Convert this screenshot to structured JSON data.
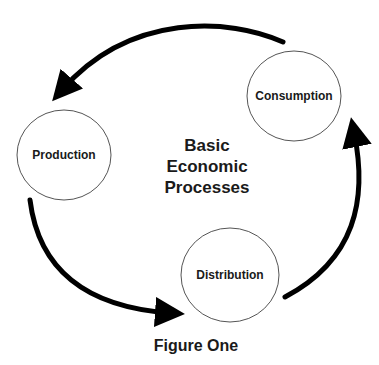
{
  "diagram": {
    "title_lines": [
      "Basic",
      "Economic",
      "Processes"
    ],
    "caption": "Figure One",
    "nodes": [
      {
        "id": "production",
        "label": "Production"
      },
      {
        "id": "distribution",
        "label": "Distribution"
      },
      {
        "id": "consumption",
        "label": "Consumption"
      }
    ],
    "edges": [
      {
        "from": "production",
        "to": "distribution"
      },
      {
        "from": "distribution",
        "to": "consumption"
      },
      {
        "from": "consumption",
        "to": "production"
      }
    ],
    "colors": {
      "arrow": "#000000",
      "node_border": "#555555",
      "text": "#1a1a1a",
      "background": "#ffffff"
    }
  }
}
